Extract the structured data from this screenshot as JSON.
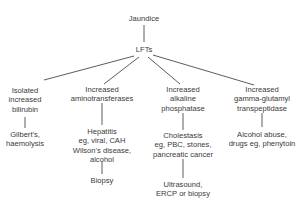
{
  "diagram": {
    "root": {
      "label": "Jaundice"
    },
    "test": {
      "label": "LFTs"
    },
    "branches": [
      {
        "finding": [
          "Isolated",
          "increased",
          "bilirubin"
        ],
        "causes": [
          "Gilbert's,",
          "haemolysis"
        ],
        "next": []
      },
      {
        "finding": [
          "Increased",
          "aminotransferases"
        ],
        "causes": [
          "Hepatitis",
          "eg, viral, CAH",
          "Wilson's disease,",
          "alcohol"
        ],
        "next": [
          "Biopsy"
        ]
      },
      {
        "finding": [
          "Increased",
          "alkaline",
          "phosphatase"
        ],
        "causes": [
          "Cholestasis",
          "eg, PBC, stones,",
          "pancreatic cancer"
        ],
        "next": [
          "Ultrasound,",
          "ERCP or biopsy"
        ]
      },
      {
        "finding": [
          "Increased",
          "gamma-glutamyl",
          "transpeptidase"
        ],
        "causes": [
          "Alcohol abuse,",
          "drugs eg, phenytoin"
        ],
        "next": []
      }
    ],
    "line_color": "#4a4a4a",
    "text_color": "#3a3a3a"
  }
}
